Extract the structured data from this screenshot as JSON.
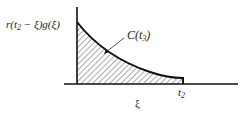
{
  "figure": {
    "y_label_parts": {
      "pre": "r(t",
      "sub": "2",
      "post": " − ξ)g(ξ)"
    },
    "area_label_parts": {
      "pre": "C(t",
      "sub": "3",
      "post": ")"
    },
    "t_mark_parts": {
      "pre": "t",
      "sub": "2"
    },
    "x_axis_label": "ξ"
  },
  "colors": {
    "ink": "#222222",
    "background": "#ffffff"
  }
}
